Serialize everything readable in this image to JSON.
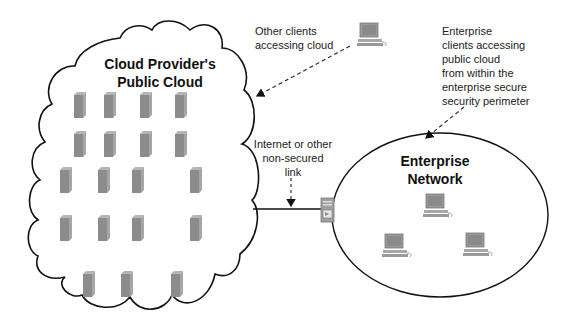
{
  "cloud": {
    "title_line1": "Cloud Provider's",
    "title_line2": "Public Cloud",
    "servers": [
      {
        "x": 74,
        "y": 92
      },
      {
        "x": 104,
        "y": 92
      },
      {
        "x": 140,
        "y": 92
      },
      {
        "x": 175,
        "y": 92
      },
      {
        "x": 74,
        "y": 131
      },
      {
        "x": 104,
        "y": 131
      },
      {
        "x": 140,
        "y": 131
      },
      {
        "x": 175,
        "y": 131
      },
      {
        "x": 60,
        "y": 167
      },
      {
        "x": 98,
        "y": 167
      },
      {
        "x": 132,
        "y": 167
      },
      {
        "x": 190,
        "y": 167
      },
      {
        "x": 60,
        "y": 215
      },
      {
        "x": 98,
        "y": 215
      },
      {
        "x": 132,
        "y": 215
      },
      {
        "x": 190,
        "y": 215
      },
      {
        "x": 83,
        "y": 271
      },
      {
        "x": 121,
        "y": 271
      },
      {
        "x": 171,
        "y": 271
      }
    ]
  },
  "labels": {
    "other_clients_line1": "Other clients",
    "other_clients_line2": "accessing cloud",
    "enterprise_clients": [
      "Enterprise",
      "clients accessing",
      "public cloud",
      "from within the",
      "enterprise secure",
      "security perimeter"
    ],
    "link_line1": "Internet or other",
    "link_line2": "non-secured",
    "link_line3": "link"
  },
  "enterprise": {
    "title_line1": "Enterprise",
    "title_line2": "Network",
    "computers": [
      {
        "x": 422,
        "y": 193
      },
      {
        "x": 381,
        "y": 233
      },
      {
        "x": 462,
        "y": 232
      }
    ]
  },
  "external_client": {
    "x": 356,
    "y": 22
  },
  "firewall": {
    "x": 320,
    "y": 196
  },
  "colors": {
    "server": "#8c8c8c",
    "server_top": "#b5b5b5",
    "outline": "#111111",
    "text": "#222222"
  }
}
